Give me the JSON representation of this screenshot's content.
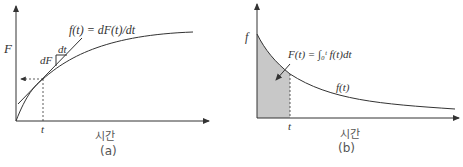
{
  "panel_a": {
    "y_label": "F",
    "equation": "f(t) = dF(t)/dt",
    "dt_label": "dt",
    "dF_label": "dF",
    "t_tick": "t",
    "x_label": "시간",
    "caption": "(a)"
  },
  "panel_b": {
    "y_label": "f",
    "integral_label": "F(t) = ∫₀ᵗ f(t)dt",
    "curve_label": "f(t)",
    "t_tick": "t",
    "x_label": "시간",
    "caption": "(b)",
    "shade_color": "#c8c8c8"
  },
  "colors": {
    "line": "#333333",
    "shade": "#c8c8c8"
  }
}
